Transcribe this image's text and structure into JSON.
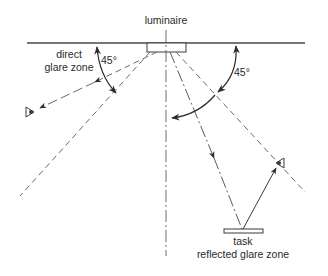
{
  "diagram": {
    "labels": {
      "luminaire": "luminaire",
      "direct_line1": "direct",
      "direct_line2": "glare zone",
      "angle_left": "45°",
      "angle_right": "45°",
      "task": "task",
      "reflected": "reflected glare zone"
    },
    "colors": {
      "line": "#3a3a3a",
      "dashed": "#6a6a6a",
      "background": "#ffffff"
    },
    "icons": {
      "left_eye": "eye-icon",
      "right_eye": "eye-icon",
      "luminaire": "luminaire-fixture",
      "task": "task-surface"
    }
  }
}
